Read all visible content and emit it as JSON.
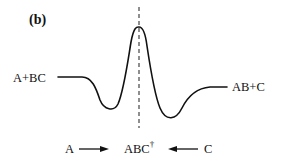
{
  "panel_label": "(b)",
  "curve": {
    "description": "Potential energy profile along reaction coordinate with two wells and a central barrier",
    "stroke_color": "#111111"
  },
  "labels": {
    "reactants": "A+BC",
    "products": "AB+C",
    "bottom_left": "A",
    "transition_state": "ABC",
    "transition_state_mark": "†",
    "bottom_right": "C"
  },
  "dashed_line": {
    "color": "#444444"
  }
}
